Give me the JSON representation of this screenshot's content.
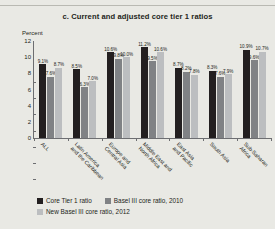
{
  "figure": {
    "panel_letter": "c.",
    "title": "c.  Current and adjusted core tier 1 ratios",
    "axis_unit": "Percent"
  },
  "legend": {
    "items": [
      {
        "label": "Core Tier 1 ratio",
        "color": "#231f20"
      },
      {
        "label": "Basel III core ratio, 2010",
        "color": "#808285"
      },
      {
        "label": "New Basel III core ratio, 2012",
        "color": "#bcbec0"
      }
    ]
  },
  "chart_data": {
    "type": "bar",
    "title": "c.  Current and adjusted core tier 1 ratios",
    "xlabel": "",
    "ylabel": "Percent",
    "ylim": [
      0,
      12
    ],
    "yticks": [
      0,
      2,
      4,
      6,
      8,
      10,
      12
    ],
    "ytick_labels": [
      "0",
      "2",
      "4",
      "6",
      "8",
      "10",
      "12"
    ],
    "grid": false,
    "legend_position": "bottom-left",
    "categories": [
      "ALL",
      "Latin America and the Caribbean",
      "Europe and Central Asia",
      "Middle East and North Africa",
      "East Asia and Pacific",
      "South Asia",
      "Sub-Saharan Africa"
    ],
    "category_lines": [
      [
        "ALL",
        ""
      ],
      [
        "Latin America",
        "and the Caribbean"
      ],
      [
        "Europe and",
        "Central Asia"
      ],
      [
        "Middle East and",
        "North Africa"
      ],
      [
        "East Asia",
        "and Pacific"
      ],
      [
        "South Asia",
        ""
      ],
      [
        "Sub-Saharan",
        "Africa"
      ]
    ],
    "series": [
      {
        "name": "Core Tier 1 ratio",
        "color": "#231f20",
        "values": [
          9.1,
          8.5,
          10.6,
          11.2,
          8.7,
          8.3,
          10.9
        ],
        "labels": [
          "9.1%",
          "8.5%",
          "10.6%",
          "11.2%",
          "8.7%",
          "8.3%",
          "10.9%"
        ]
      },
      {
        "name": "Basel III core ratio, 2010",
        "color": "#808285",
        "values": [
          7.6,
          6.3,
          9.8,
          9.5,
          8.2,
          7.6,
          9.6
        ],
        "labels": [
          "7.6%",
          "6.3%",
          "9.8%",
          "9.5%",
          "8.2%",
          "7.6%",
          "9.6%"
        ]
      },
      {
        "name": "New Basel III core ratio, 2012",
        "color": "#bcbec0",
        "values": [
          8.7,
          7.0,
          10.0,
          10.6,
          7.8,
          7.9,
          10.7
        ],
        "labels": [
          "8.7%",
          "7.0%",
          "10.0%",
          "10.6%",
          "7.8%",
          "7.9%",
          "10.7%"
        ]
      }
    ]
  }
}
